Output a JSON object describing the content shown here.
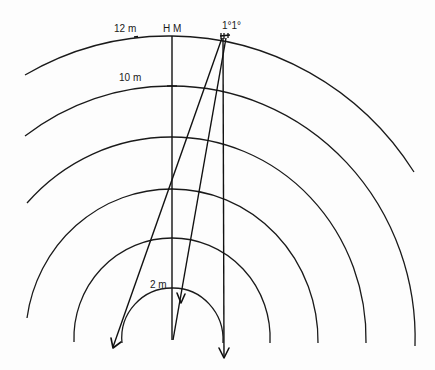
{
  "diagram": {
    "center": {
      "x": 172,
      "y": 338
    },
    "scale_px_per_m": 24.6,
    "labels": {
      "arc_12": "12 m",
      "arc_10": "10 m",
      "arc_2": "2 m",
      "hm": "H M",
      "angles": "1°1°"
    },
    "arcs": [
      {
        "name": "2 m",
        "radius_m": 2,
        "left_end": [
          122,
          343
        ],
        "right_end": [
          223,
          343
        ]
      },
      {
        "name": "4 m",
        "radius_m": 4,
        "left_end": [
          74,
          342
        ],
        "right_end": [
          270,
          343
        ]
      },
      {
        "name": "6 m",
        "radius_m": 6,
        "left_end": [
          27,
          318
        ],
        "right_end": [
          318,
          343
        ]
      },
      {
        "name": "8 m",
        "radius_m": 8,
        "left_end": [
          27,
          203
        ],
        "right_end": [
          366,
          343
        ]
      },
      {
        "name": "10 m",
        "radius_m": 10,
        "left_end": [
          25,
          136
        ],
        "right_end": [
          415,
          346
        ]
      },
      {
        "name": "12 m",
        "radius_m": 12,
        "left_end": [
          25,
          75
        ],
        "right_end": [
          414,
          172
        ]
      }
    ],
    "rays": [
      {
        "name": "central vertical (H M)",
        "from": [
          172,
          36
        ],
        "to": [
          172,
          340
        ]
      },
      {
        "name": "ray left (-1°)",
        "from": [
          222,
          38
        ],
        "to": [
          113,
          347
        ],
        "arrow": true
      },
      {
        "name": "ray middle",
        "from": [
          226,
          38
        ],
        "to": [
          173,
          340
        ],
        "arrow_at": [
          181,
          302
        ]
      },
      {
        "name": "ray vertical right (+1°)",
        "from": [
          223,
          38
        ],
        "to": [
          224,
          358
        ],
        "arrow": true
      }
    ]
  }
}
